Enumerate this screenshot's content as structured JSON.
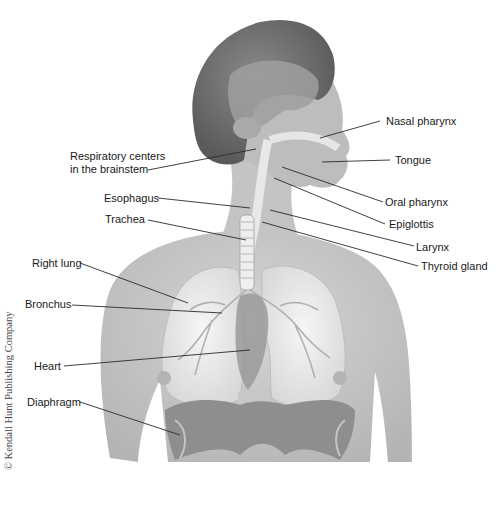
{
  "figure": {
    "credit": "© Kendall Hunt Publishing Company"
  },
  "labels": {
    "respiratory_centers_line1": "Respiratory centers",
    "respiratory_centers_line2": "in the brainstem",
    "esophagus": "Esophagus",
    "trachea": "Trachea",
    "right_lung": "Right lung",
    "bronchus": "Bronchus",
    "heart": "Heart",
    "diaphragm": "Diaphragm",
    "nasal_pharynx": "Nasal pharynx",
    "tongue": "Tongue",
    "oral_pharynx": "Oral pharynx",
    "epiglottis": "Epiglottis",
    "larynx": "Larynx",
    "thyroid_gland": "Thyroid gland"
  },
  "colors": {
    "skin": "#c9c9c9",
    "hair": "#6e6e6e",
    "lung": "#ededed",
    "diaphragm": "#8e8e8e",
    "leader_line": "#2a2a2a",
    "text": "#1a1a1a"
  }
}
